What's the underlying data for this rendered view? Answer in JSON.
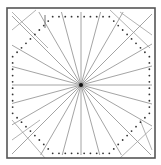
{
  "diagram": {
    "type": "geometric-radial-pattern",
    "width": 161,
    "height": 165,
    "frame": {
      "x": 7,
      "y": 8,
      "w": 148,
      "h": 150,
      "stroke": "#555555",
      "stroke_width": 1.6
    },
    "center": {
      "x": 81,
      "y": 85
    },
    "ray_extent": {
      "x0": 12,
      "y0": 12,
      "x1": 152,
      "y1": 155
    },
    "ray_count": 24,
    "ray_color": "#9a9a9a",
    "center_dot_color": "#111111",
    "dotted_outline": {
      "sides": 8,
      "radius": 74,
      "rotation_deg": 22.5,
      "color": "#333333"
    },
    "corner_lines_color": "#a0a0a0",
    "marker": {
      "x": 45,
      "y1": 15,
      "y2": 28,
      "color": "#777777"
    }
  }
}
